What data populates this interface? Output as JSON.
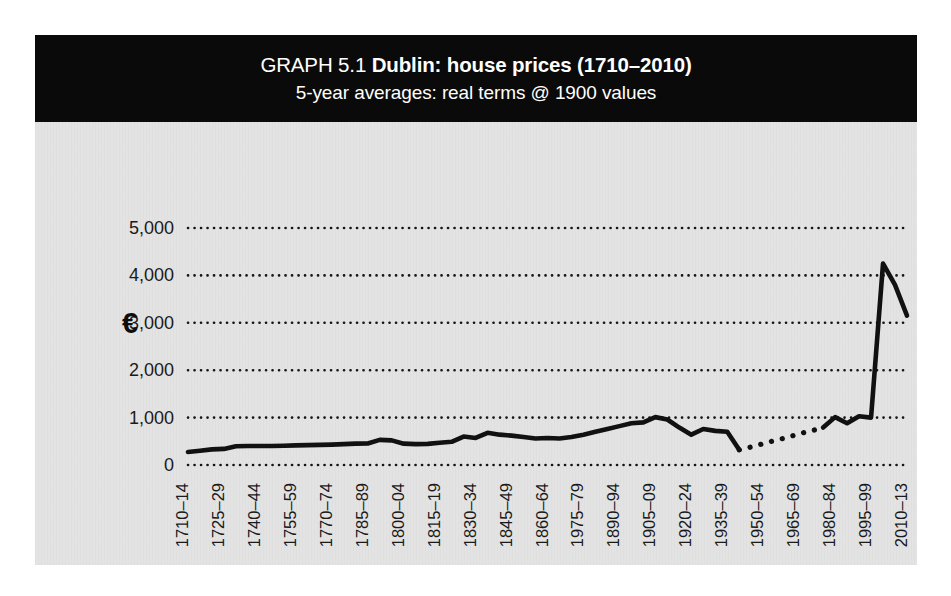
{
  "figure": {
    "title_prefix": "GRAPH 5.1 ",
    "title_main": "Dublin: house prices (1710–2010)",
    "subtitle": "5-year averages: real terms @ 1900 values",
    "currency_symbol": "€",
    "panel_color": "#e3e3e3",
    "banner_color": "#0a0a0a",
    "series_color": "#111111"
  },
  "chart_data": {
    "type": "line",
    "title": "GRAPH 5.1 Dublin: house prices (1710–2010)",
    "subtitle": "5-year averages: real terms @ 1900 values",
    "xlabel": "",
    "ylabel": "€",
    "ylim": [
      0,
      5000
    ],
    "yticks": [
      0,
      1000,
      2000,
      3000,
      4000,
      5000
    ],
    "ytick_labels": [
      "0",
      "1,000",
      "2,000",
      "3,000",
      "4,000",
      "5,000"
    ],
    "grid": "horizontal-dotted",
    "legend": "none",
    "xtick_labels": [
      "1710–14",
      "1725–29",
      "1740–44",
      "1755–59",
      "1770–74",
      "1785–89",
      "1800–04",
      "1815–19",
      "1830–34",
      "1845–49",
      "1860–64",
      "1975–79",
      "1890–94",
      "1905–09",
      "1920–24",
      "1935–39",
      "1950–54",
      "1965–69",
      "1980–84",
      "1995–99",
      "2010–13"
    ],
    "xtick_interval_periods": 3,
    "x_periods": [
      "1710-14",
      "1715-19",
      "1720-24",
      "1725-29",
      "1730-34",
      "1735-39",
      "1740-44",
      "1745-49",
      "1750-54",
      "1755-59",
      "1760-64",
      "1765-69",
      "1770-74",
      "1775-79",
      "1780-84",
      "1785-89",
      "1790-94",
      "1795-99",
      "1800-04",
      "1805-09",
      "1810-14",
      "1815-19",
      "1820-24",
      "1825-29",
      "1830-34",
      "1835-39",
      "1840-44",
      "1845-49",
      "1850-54",
      "1855-59",
      "1860-64",
      "1865-69",
      "1870-74",
      "1875-79",
      "1880-84",
      "1885-89",
      "1890-94",
      "1895-99",
      "1900-04",
      "1905-09",
      "1910-14",
      "1915-19",
      "1920-24",
      "1925-29",
      "1930-34",
      "1935-39",
      "1940-44",
      "1945-49",
      "1950-54",
      "1955-59",
      "1960-64",
      "1965-69",
      "1970-74",
      "1975-79",
      "1980-84",
      "1985-89",
      "1990-94",
      "1995-99",
      "2000-04",
      "2005-09",
      "2010-13"
    ],
    "values": [
      275,
      300,
      330,
      340,
      395,
      400,
      400,
      400,
      405,
      415,
      420,
      425,
      430,
      440,
      450,
      455,
      530,
      520,
      450,
      440,
      445,
      470,
      490,
      600,
      570,
      680,
      640,
      620,
      590,
      560,
      570,
      560,
      590,
      640,
      700,
      760,
      820,
      880,
      900,
      1010,
      960,
      790,
      640,
      760,
      720,
      700,
      320,
      380,
      450,
      520,
      580,
      660,
      720,
      790,
      1010,
      880,
      1030,
      1000,
      4250,
      3800,
      3150
    ],
    "estimated_from_period": "1940-44",
    "estimated_to_period": "1975-79",
    "estimated_note": "dotted segment indicates estimated values",
    "peak_value": 4250,
    "peak_period": "2000-04",
    "final_value": 3150
  }
}
